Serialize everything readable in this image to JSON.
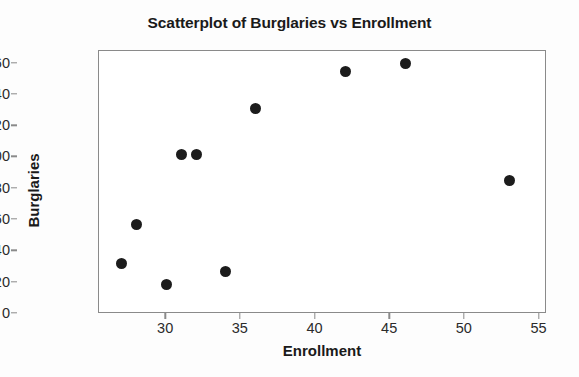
{
  "chart_data": {
    "type": "scatter",
    "title": "Scatterplot of Burglaries vs Enrollment",
    "xlabel": "Enrollment",
    "ylabel": "Burglaries",
    "xlim": [
      25.5,
      55.5
    ],
    "ylim": [
      0,
      168
    ],
    "xticks": [
      30,
      35,
      40,
      45,
      50,
      55
    ],
    "yticks": [
      0,
      20,
      40,
      60,
      80,
      100,
      120,
      140,
      160
    ],
    "grid": false,
    "legend": null,
    "marker": {
      "shape": "circle",
      "color": "#1c1c1c",
      "size": 11
    },
    "points": [
      {
        "x": 27,
        "y": 32
      },
      {
        "x": 28,
        "y": 57
      },
      {
        "x": 30,
        "y": 19
      },
      {
        "x": 31,
        "y": 102
      },
      {
        "x": 32,
        "y": 102
      },
      {
        "x": 34,
        "y": 27
      },
      {
        "x": 36,
        "y": 131
      },
      {
        "x": 42,
        "y": 155
      },
      {
        "x": 46,
        "y": 160
      },
      {
        "x": 53,
        "y": 85
      }
    ],
    "series": [
      {
        "name": "Burglaries vs Enrollment",
        "x": [
          27,
          28,
          30,
          31,
          32,
          34,
          36,
          42,
          46,
          53
        ],
        "values": [
          32,
          57,
          19,
          102,
          102,
          27,
          131,
          155,
          160,
          85
        ]
      }
    ]
  },
  "colors": {
    "marker": "#1c1c1c",
    "frame": "#8a8a8a",
    "text": "#1a1a1a",
    "tick_text": "#2b2b2b",
    "background": "#ffffff"
  }
}
